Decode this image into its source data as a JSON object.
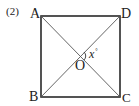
{
  "problem": {
    "number": "(2)"
  },
  "figure": {
    "shape": "square",
    "vertices": {
      "A": "A",
      "B": "B",
      "C": "C",
      "D": "D"
    },
    "center": "O",
    "angle": {
      "variable": "x",
      "unit": "°"
    },
    "colors": {
      "stroke": "#2a2a2a",
      "diagonal": "#555555",
      "text": "#222222"
    }
  }
}
